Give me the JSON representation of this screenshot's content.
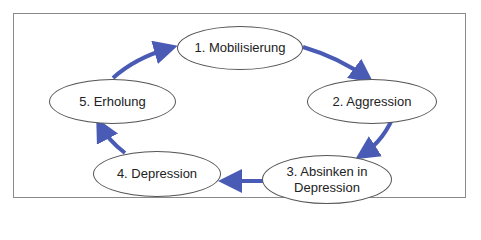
{
  "diagram": {
    "type": "cycle",
    "arrow_color": "#4a5bb5",
    "frame_color": "#8a8a8a",
    "nodes": [
      {
        "id": 1,
        "label": "1. Mobilisierung"
      },
      {
        "id": 2,
        "label": "2. Aggression"
      },
      {
        "id": 3,
        "label": "3. Absinken in Depression",
        "line1": "3. Absinken in",
        "line2": "Depression"
      },
      {
        "id": 4,
        "label": "4. Depression"
      },
      {
        "id": 5,
        "label": "5. Erholung"
      }
    ],
    "edges": [
      {
        "from": 1,
        "to": 2
      },
      {
        "from": 2,
        "to": 3
      },
      {
        "from": 3,
        "to": 4
      },
      {
        "from": 4,
        "to": 5
      },
      {
        "from": 5,
        "to": 1
      }
    ]
  }
}
